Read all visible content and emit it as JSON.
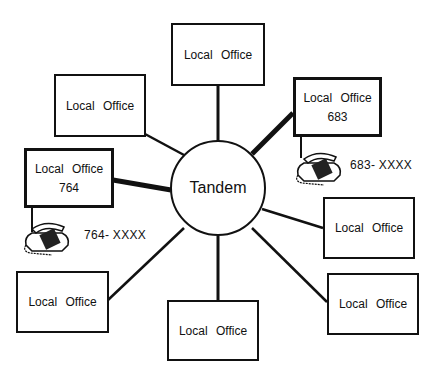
{
  "diagram": {
    "hub": {
      "label": "Tandem"
    },
    "offices": [
      {
        "id": "top",
        "label": "Local Office"
      },
      {
        "id": "top-left",
        "label": "Local Office"
      },
      {
        "id": "office-683",
        "label": "Local Office",
        "number": "683",
        "phone": "683- XXXX"
      },
      {
        "id": "office-764",
        "label": "Local Office",
        "number": "764",
        "phone": "764- XXXX"
      },
      {
        "id": "right",
        "label": "Local Office"
      },
      {
        "id": "bottom-right",
        "label": "Local Office"
      },
      {
        "id": "bottom",
        "label": "Local Office"
      },
      {
        "id": "bottom-left",
        "label": "Local Office"
      }
    ],
    "colors": {
      "line": "#111111",
      "background": "#ffffff"
    }
  }
}
